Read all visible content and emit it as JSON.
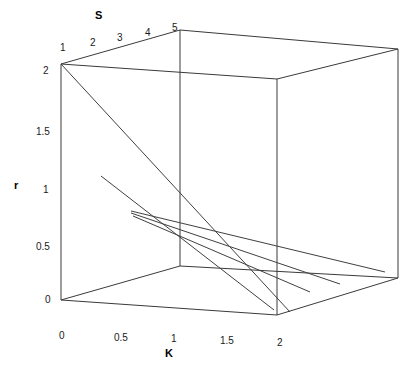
{
  "chart_data": {
    "type": "line",
    "title": "",
    "subtitle": "",
    "projection": "3d-cube-wireframe",
    "grid": false,
    "legend": null,
    "axes": {
      "x": {
        "name": "K",
        "label": "K",
        "ticks": [
          "0",
          "0.5",
          "1",
          "1.5",
          "2"
        ],
        "tick_values": [
          0,
          0.5,
          1,
          1.5,
          2
        ],
        "lim": [
          0,
          2
        ]
      },
      "y": {
        "name": "S",
        "label": "S",
        "ticks": [
          "1",
          "2",
          "3",
          "4",
          "5"
        ],
        "tick_values": [
          1,
          2,
          3,
          4,
          5
        ],
        "lim": [
          1,
          5
        ]
      },
      "z": {
        "name": "r",
        "label": "r",
        "ticks": [
          "0",
          "0.5",
          "1",
          "1.5",
          "2"
        ],
        "tick_values": [
          0,
          0.5,
          1,
          1.5,
          2
        ],
        "lim": [
          0,
          2
        ]
      }
    },
    "series": [
      {
        "name": "line-1",
        "screen_points": [
          [
            61,
            64
          ],
          [
            290,
            312
          ]
        ],
        "color": "#404040"
      },
      {
        "name": "line-2",
        "screen_points": [
          [
            101,
            176
          ],
          [
            274,
            310
          ]
        ],
        "color": "#404040"
      },
      {
        "name": "line-3",
        "screen_points": [
          [
            131,
            211
          ],
          [
            385,
            272
          ]
        ],
        "color": "#404040"
      },
      {
        "name": "line-4",
        "screen_points": [
          [
            131,
            213
          ],
          [
            340,
            284
          ]
        ],
        "color": "#404040"
      },
      {
        "name": "line-5",
        "screen_points": [
          [
            133,
            216
          ],
          [
            310,
            292
          ]
        ],
        "color": "#404040"
      }
    ],
    "cube": {
      "front_bottom_left": [
        61,
        300
      ],
      "front_bottom_right": [
        277,
        315
      ],
      "front_top_left": [
        61,
        64
      ],
      "front_top_right": [
        277,
        79
      ],
      "back_bottom_left": [
        180,
        266
      ],
      "back_bottom_right": [
        398,
        278
      ],
      "back_top_left": [
        180,
        30
      ],
      "back_top_right": [
        398,
        49
      ]
    },
    "line_color": "#555555",
    "frame_color": "#3a3a3a",
    "background": "#ffffff"
  },
  "axis_titles": {
    "x": "K",
    "y": "S",
    "z": "r"
  },
  "x_ticks": [
    {
      "label": "0",
      "x": 59,
      "y": 331
    },
    {
      "label": "0.5",
      "x": 114,
      "y": 333
    },
    {
      "label": "1",
      "x": 171,
      "y": 334
    },
    {
      "label": "1.5",
      "x": 220,
      "y": 336
    },
    {
      "label": "2",
      "x": 277,
      "y": 338
    }
  ],
  "y_ticks": [
    {
      "label": "1",
      "x": 60,
      "y": 43
    },
    {
      "label": "2",
      "x": 90,
      "y": 38
    },
    {
      "label": "3",
      "x": 117,
      "y": 33
    },
    {
      "label": "4",
      "x": 145,
      "y": 28
    },
    {
      "label": "5",
      "x": 172,
      "y": 23
    }
  ],
  "z_ticks": [
    {
      "label": "2",
      "x": 43,
      "y": 66
    },
    {
      "label": "1.5",
      "x": 36,
      "y": 127
    },
    {
      "label": "1",
      "x": 43,
      "y": 185
    },
    {
      "label": "0.5",
      "x": 36,
      "y": 242
    },
    {
      "label": "0",
      "x": 45,
      "y": 295
    }
  ]
}
